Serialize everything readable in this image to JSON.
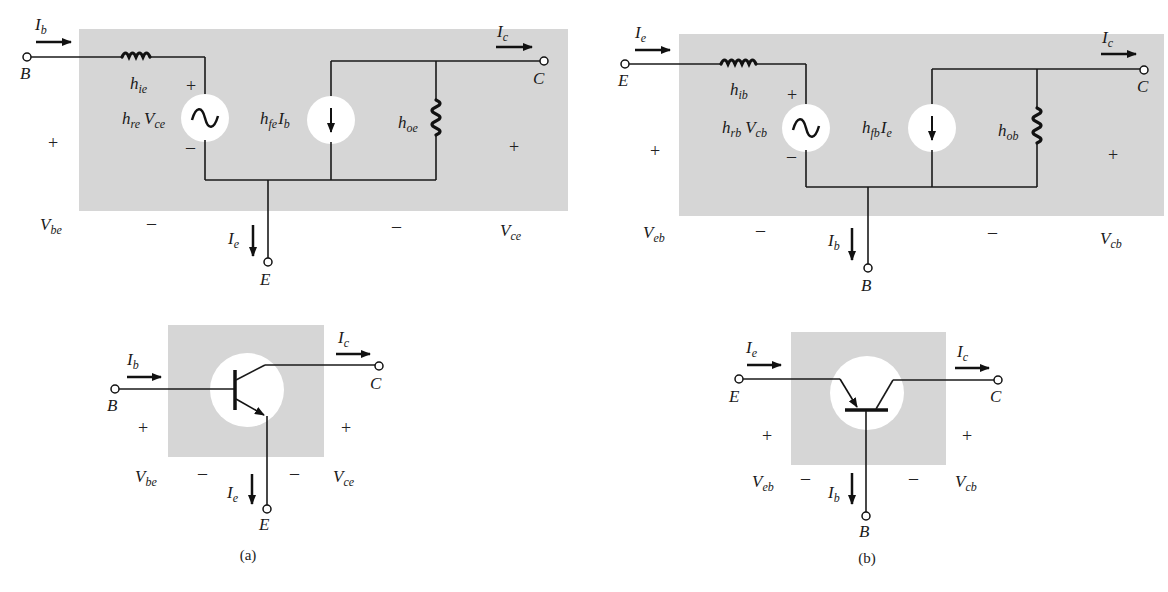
{
  "figure": {
    "panel_a": {
      "caption": "(a)",
      "configuration": "common-emitter",
      "equivalent_circuit": {
        "terminals": {
          "input": "B",
          "output": "C",
          "common": "E"
        },
        "currents": {
          "input": {
            "main": "I",
            "sub": "b"
          },
          "output": {
            "main": "I",
            "sub": "c"
          },
          "common": {
            "main": "I",
            "sub": "e"
          }
        },
        "input_resistance": {
          "main": "h",
          "sub": "ie"
        },
        "voltage_source": {
          "coef_main": "h",
          "coef_sub": "re",
          "var_main": "V",
          "var_sub": "ce"
        },
        "current_source": {
          "coef_main": "h",
          "coef_sub": "fe",
          "var_main": "I",
          "var_sub": "b"
        },
        "output_conductance": {
          "main": "h",
          "sub": "oe"
        },
        "input_voltage": {
          "main": "V",
          "sub": "be"
        },
        "output_voltage": {
          "main": "V",
          "sub": "ce"
        },
        "plus": "+",
        "minus": "–"
      },
      "transistor_symbol": {
        "type": "npn",
        "terminals": {
          "input": "B",
          "output": "C",
          "common": "E"
        },
        "currents": {
          "input": {
            "main": "I",
            "sub": "b"
          },
          "output": {
            "main": "I",
            "sub": "c"
          },
          "common": {
            "main": "I",
            "sub": "e"
          }
        },
        "input_voltage": {
          "main": "V",
          "sub": "be"
        },
        "output_voltage": {
          "main": "V",
          "sub": "ce"
        },
        "plus": "+",
        "minus": "–"
      }
    },
    "panel_b": {
      "caption": "(b)",
      "configuration": "common-base",
      "equivalent_circuit": {
        "terminals": {
          "input": "E",
          "output": "C",
          "common": "B"
        },
        "currents": {
          "input": {
            "main": "I",
            "sub": "e"
          },
          "output": {
            "main": "I",
            "sub": "c"
          },
          "common": {
            "main": "I",
            "sub": "b"
          }
        },
        "input_resistance": {
          "main": "h",
          "sub": "ib"
        },
        "voltage_source": {
          "coef_main": "h",
          "coef_sub": "rb",
          "var_main": "V",
          "var_sub": "cb"
        },
        "current_source": {
          "coef_main": "h",
          "coef_sub": "fb",
          "var_main": "I",
          "var_sub": "e"
        },
        "output_conductance": {
          "main": "h",
          "sub": "ob"
        },
        "input_voltage": {
          "main": "V",
          "sub": "eb"
        },
        "output_voltage": {
          "main": "V",
          "sub": "cb"
        },
        "plus": "+",
        "minus": "–"
      },
      "transistor_symbol": {
        "type": "npn",
        "terminals": {
          "input": "E",
          "output": "C",
          "common": "B"
        },
        "currents": {
          "input": {
            "main": "I",
            "sub": "e"
          },
          "output": {
            "main": "I",
            "sub": "c"
          },
          "common": {
            "main": "I",
            "sub": "b"
          }
        },
        "input_voltage": {
          "main": "V",
          "sub": "eb"
        },
        "output_voltage": {
          "main": "V",
          "sub": "cb"
        },
        "plus": "+",
        "minus": "–"
      }
    },
    "colors": {
      "shade": "#d6d6d6",
      "ink": "#1a1a1a",
      "background": "#ffffff"
    }
  }
}
